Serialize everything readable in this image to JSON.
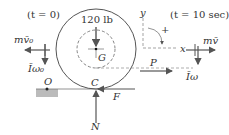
{
  "diagram": {
    "type": "free-body / impulse-momentum diagram of rolling wheel",
    "labels": {
      "t0": "(t = 0)",
      "t10": "(t = 10 sec)",
      "weight": "120 lb",
      "center": "G",
      "contact": "C",
      "pivot": "O",
      "momentum_initial": "mv̄₀",
      "angular_momentum_initial": "Īω₀",
      "momentum_final": "mv̄",
      "angular_momentum_final": "Īω",
      "force_P": "P",
      "friction": "F",
      "normal": "N",
      "axis_x": "x",
      "axis_y": "y",
      "positive_sense": "+"
    },
    "colors": {
      "line": "#555555",
      "ground": "#999999"
    }
  }
}
